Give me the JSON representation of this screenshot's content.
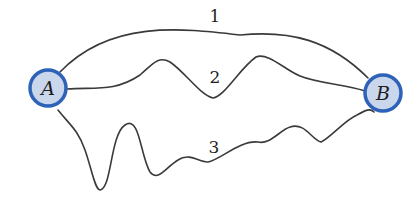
{
  "diagram": {
    "nodes": [
      {
        "id": "A",
        "label": "A"
      },
      {
        "id": "B",
        "label": "B"
      }
    ],
    "paths": [
      {
        "id": "1",
        "label": "1",
        "from": "A",
        "to": "B",
        "shape": "smooth arc over the top"
      },
      {
        "id": "2",
        "label": "2",
        "from": "A",
        "to": "B",
        "shape": "wavy middle path"
      },
      {
        "id": "3",
        "label": "3",
        "from": "A",
        "to": "B",
        "shape": "strongly wiggly lower path"
      }
    ],
    "colors": {
      "node_fill": "#c9d6ec",
      "node_stroke": "#2e62b8",
      "line": "#3a3a3a",
      "text": "#1e1e1e"
    }
  }
}
